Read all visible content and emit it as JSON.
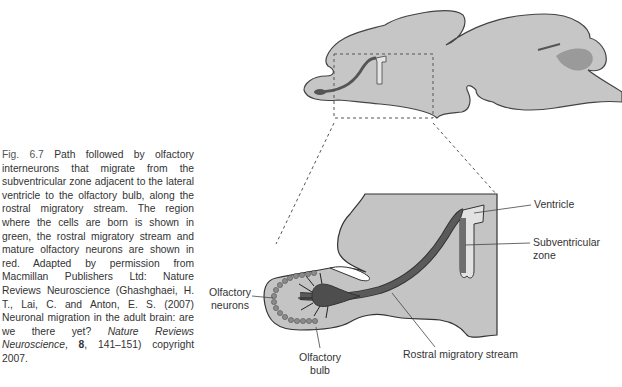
{
  "figure": {
    "number": "Fig. 6.7",
    "caption_parts": {
      "lead": "Path followed by olfactory interneurons that migrate from the subventricular zone adjacent to the lateral ventricle to the olfactory bulb, along the rostral migratory stream. The region where the cells are born is shown in green, the rostral migratory stream and mature olfactory neurons are shown in red. Adapted by permission from Macmillan Publishers Ltd: Nature Reviews Neuroscience (Ghashghaei, H. T., Lai, C. and Anton, E. S. (2007) Neuronal migration in the adult brain: are we there yet? ",
      "journal": "Nature Reviews Neuroscience",
      "comma": ", ",
      "volume": "8",
      "tail": ", 141–151) copyright 2007."
    }
  },
  "diagram": {
    "labels": {
      "ventricle": "Ventricle",
      "subventricular_zone": "Subventricular zone",
      "olfactory_neurons_line1": "Olfactory",
      "olfactory_neurons_line2": "neurons",
      "olfactory_bulb_line1": "Olfactory",
      "olfactory_bulb_line2": "bulb",
      "rostral_migratory_stream": "Rostral migratory stream"
    },
    "colors": {
      "brain_fill": "#c4c4c4",
      "outline": "#333333",
      "stream": "#5a5a5a",
      "svz": "#7a7a7a",
      "ventricle_fill": "#e2e2e2",
      "inset_bg": "#c4c4c4"
    }
  }
}
